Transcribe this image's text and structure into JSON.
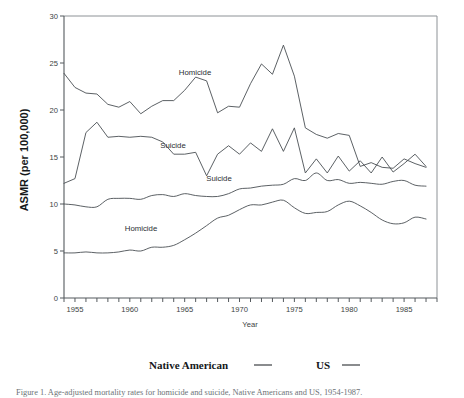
{
  "figure": {
    "background": "#ffffff",
    "ink": "#4a4f53"
  },
  "axes": {
    "y_title": "ASMR (per 100,000)",
    "x_title": "Year",
    "y_ticks": [
      "0",
      "5",
      "10",
      "15",
      "20",
      "25",
      "30"
    ],
    "x_ticks": [
      "1955",
      "1960",
      "1965",
      "1970",
      "1975",
      "1980",
      "1985"
    ]
  },
  "annotations": {
    "na_homicide": "Homicide",
    "na_suicide": "Suicide",
    "us_suicide": "Suicide",
    "us_homicide": "Homicide"
  },
  "legend": {
    "entries": [
      {
        "label": "Native American",
        "rule": "solid-line"
      },
      {
        "label": "US",
        "rule": "solid-line"
      }
    ]
  },
  "caption": {
    "text": "Figure 1.  Age-adjusted mortality rates for homicide and suicide, Native Americans and US, 1954-1987."
  },
  "chart_data": {
    "type": "line",
    "title": "",
    "xlabel": "Year",
    "ylabel": "ASMR (per 100,000)",
    "xlim": [
      1954,
      1988
    ],
    "ylim": [
      0,
      30
    ],
    "grid": false,
    "legend_position": "below-plot",
    "x": [
      1954,
      1955,
      1956,
      1957,
      1958,
      1959,
      1960,
      1961,
      1962,
      1963,
      1964,
      1965,
      1966,
      1967,
      1968,
      1969,
      1970,
      1971,
      1972,
      1973,
      1974,
      1975,
      1976,
      1977,
      1978,
      1979,
      1980,
      1981,
      1982,
      1983,
      1984,
      1985,
      1986,
      1987
    ],
    "series": [
      {
        "name": "Native American homicide",
        "group": "Native American",
        "cause": "Homicide",
        "values": [
          23.9,
          22.4,
          21.8,
          21.7,
          20.6,
          20.3,
          20.9,
          19.6,
          20.4,
          21.0,
          21.0,
          22.1,
          23.5,
          23.1,
          19.7,
          20.4,
          20.3,
          22.8,
          24.9,
          23.8,
          26.9,
          23.6,
          18.1,
          17.4,
          17.0,
          17.5,
          17.3,
          14.0,
          14.4,
          13.9,
          13.8,
          14.8,
          14.3,
          13.9
        ]
      },
      {
        "name": "Native American suicide",
        "group": "Native American",
        "cause": "Suicide",
        "values": [
          12.2,
          12.7,
          17.6,
          18.7,
          17.1,
          17.2,
          17.1,
          17.2,
          17.1,
          16.6,
          15.3,
          15.3,
          15.5,
          13.0,
          15.3,
          16.2,
          15.3,
          16.5,
          15.6,
          18.0,
          15.6,
          18.1,
          13.3,
          14.8,
          13.3,
          15.1,
          13.5,
          14.6,
          13.3,
          15.0,
          13.4,
          14.3,
          15.3,
          14.0
        ]
      },
      {
        "name": "US suicide",
        "group": "US",
        "cause": "Suicide",
        "values": [
          10.0,
          9.9,
          9.7,
          9.7,
          10.5,
          10.6,
          10.6,
          10.5,
          10.9,
          11.0,
          10.8,
          11.1,
          10.9,
          10.8,
          10.8,
          11.1,
          11.6,
          11.7,
          11.9,
          12.0,
          12.1,
          12.7,
          12.5,
          13.3,
          12.5,
          12.6,
          12.2,
          12.3,
          12.2,
          12.1,
          12.4,
          12.5,
          12.0,
          11.9
        ]
      },
      {
        "name": "US homicide",
        "group": "US",
        "cause": "Homicide",
        "values": [
          4.8,
          4.8,
          4.9,
          4.8,
          4.8,
          4.9,
          5.1,
          5.0,
          5.4,
          5.4,
          5.6,
          6.2,
          6.9,
          7.7,
          8.5,
          8.8,
          9.4,
          9.9,
          9.9,
          10.2,
          10.4,
          9.6,
          9.0,
          9.1,
          9.2,
          9.9,
          10.3,
          9.8,
          9.1,
          8.3,
          7.9,
          8.0,
          8.6,
          8.4
        ]
      }
    ]
  }
}
